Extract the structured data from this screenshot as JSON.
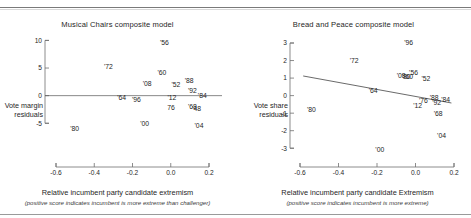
{
  "figure": {
    "background": "#ffffff",
    "axis_color": "#6f6f6f",
    "text_color": "#262626",
    "line_color": "#444444"
  },
  "panels": {
    "left": {
      "title": "Musical Chairs composite model",
      "ylabel_line1": "Vote margin",
      "ylabel_line2": "residuals",
      "xlabel": "Relative incumbent party candidate extremism",
      "xlabel_note": "(positive score indicates incumbent is more extreme than challenger)"
    },
    "right": {
      "title": "Bread and Peace composite model",
      "ylabel_line1": "Vote share",
      "ylabel_line2": "residuals",
      "xlabel": "Relative incumbent party candidate Extremism",
      "xlabel_note": "(positive score indicates incumbent is more extreme)"
    }
  },
  "chart_data": [
    {
      "type": "scatter",
      "panel": "left",
      "title": "Musical Chairs composite model",
      "xlabel": "Relative incumbent party candidate extremism",
      "xlabel_note": "(positive score indicates incumbent is more extreme than challenger)",
      "ylabel": "Vote margin residuals",
      "xlim": [
        -0.72,
        0.3
      ],
      "ylim": [
        -6.4,
        10.8
      ],
      "xticks": [
        -0.6,
        -0.4,
        -0.2,
        0.0,
        0.2
      ],
      "xticklabels": [
        "-0.6",
        "-0.4",
        "-0.2",
        "0.0",
        "0.2"
      ],
      "yticks": [
        10,
        5,
        0,
        -5
      ],
      "yticklabels": [
        "10",
        "5",
        "0",
        "-5"
      ],
      "grid": false,
      "legend": false,
      "marker_style": "year-label",
      "zero_reference_line": true,
      "fit_line": false,
      "points": [
        {
          "label": "'56",
          "x": 0.005,
          "y": 9.6
        },
        {
          "label": "'72",
          "x": -0.335,
          "y": 5.3
        },
        {
          "label": "'60",
          "x": -0.01,
          "y": 4.2
        },
        {
          "label": "'88",
          "x": 0.155,
          "y": 2.7
        },
        {
          "label": "'08",
          "x": -0.1,
          "y": 2.1
        },
        {
          "label": "'52",
          "x": 0.075,
          "y": 2.0
        },
        {
          "label": "'92",
          "x": 0.175,
          "y": 0.9
        },
        {
          "label": "'84",
          "x": 0.235,
          "y": 0.0
        },
        {
          "label": "'64",
          "x": -0.255,
          "y": -0.3
        },
        {
          "label": "'12",
          "x": 0.05,
          "y": -0.3
        },
        {
          "label": "'96",
          "x": -0.165,
          "y": -0.8
        },
        {
          "label": "'68",
          "x": 0.175,
          "y": -1.9
        },
        {
          "label": "76",
          "x": 0.045,
          "y": -2.2
        },
        {
          "label": "'48",
          "x": 0.2,
          "y": -2.4
        },
        {
          "label": "'00",
          "x": -0.115,
          "y": -5.1
        },
        {
          "label": "'04",
          "x": 0.215,
          "y": -5.4
        },
        {
          "label": "'80",
          "x": -0.54,
          "y": -5.9
        }
      ]
    },
    {
      "type": "scatter",
      "panel": "right",
      "title": "Bread and Peace composite model",
      "xlabel": "Relative incumbent party candidate Extremism",
      "xlabel_note": "(positive score indicates incumbent is more extreme)",
      "ylabel": "Vote share residuals",
      "xlim": [
        -0.72,
        0.3
      ],
      "ylim": [
        -3.5,
        3.4
      ],
      "xticks": [
        -0.6,
        -0.4,
        -0.2,
        0.0,
        0.2
      ],
      "xticklabels": [
        "-0.6",
        "-0.4",
        "-0.2",
        "0.0",
        "0.2"
      ],
      "yticks": [
        3,
        2,
        1,
        0,
        -1,
        -2,
        -3
      ],
      "yticklabels": [
        "3",
        "2",
        "1",
        "0",
        "-1",
        "-2",
        "-3"
      ],
      "grid": false,
      "legend": false,
      "marker_style": "year-label",
      "fit_line": true,
      "fit_line_endpoints": [
        {
          "x": -0.64,
          "y": 1.12
        },
        {
          "x": 0.26,
          "y": -0.42
        }
      ],
      "points": [
        {
          "label": "'96",
          "x": 0.0,
          "y": 3.05
        },
        {
          "label": "'72",
          "x": -0.33,
          "y": 2.0
        },
        {
          "label": "'56",
          "x": 0.03,
          "y": 1.32
        },
        {
          "label": "'08",
          "x": -0.045,
          "y": 1.12
        },
        {
          "label": "'60",
          "x": 0.0,
          "y": 1.1
        },
        {
          "label": "'80",
          "x": -0.015,
          "y": 1.08
        },
        {
          "label": "'52",
          "x": 0.105,
          "y": 0.98
        },
        {
          "label": "'64",
          "x": -0.215,
          "y": 0.28
        },
        {
          "label": "'88",
          "x": 0.155,
          "y": -0.13
        },
        {
          "label": "'84",
          "x": 0.225,
          "y": -0.2
        },
        {
          "label": "'76",
          "x": 0.09,
          "y": -0.28
        },
        {
          "label": "'92",
          "x": 0.17,
          "y": -0.4
        },
        {
          "label": "'12",
          "x": 0.055,
          "y": -0.58
        },
        {
          "label": "'80",
          "x": -0.59,
          "y": -0.82
        },
        {
          "label": "'68",
          "x": 0.18,
          "y": -1.05
        },
        {
          "label": "'04",
          "x": 0.2,
          "y": -2.28
        },
        {
          "label": "'00",
          "x": -0.175,
          "y": -3.05
        }
      ]
    }
  ]
}
